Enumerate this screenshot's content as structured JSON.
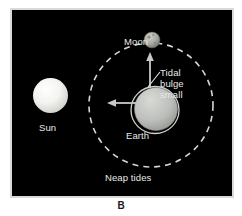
{
  "figure": {
    "caption": "B",
    "panel_background": "#000000",
    "page_background": "#ffffff"
  },
  "diagram": {
    "title_label": "Neap tides",
    "labels": {
      "moon": "Moon",
      "sun": "Sun",
      "earth": "Earth",
      "tidal_bulge": "Tidal\nbulge\nsmall",
      "tidal_bulge_line1": "Tidal",
      "tidal_bulge_line2": "bulge",
      "tidal_bulge_line3": "small",
      "neap_tides": "Neap tides"
    },
    "colors": {
      "text": "#e8e8e8",
      "sun_body": "#f2f2f0",
      "earth_body": "#b9bcb8",
      "moon_body": "#a9a9a5",
      "orbit_dash": "#d6d6d6",
      "arrow": "#cfcfcf",
      "leader_line": "#e8e8e8",
      "caption": "#1a1a1a"
    },
    "bodies": [
      {
        "name": "sun",
        "cx": 50.5,
        "cy": 95.5,
        "r": 17.5
      },
      {
        "name": "earth",
        "cx": 143,
        "cy": 100,
        "r": 22
      },
      {
        "name": "moon",
        "cx": 140,
        "cy": 30,
        "r": 8
      }
    ],
    "orbit": {
      "cx": 139,
      "cy": 95,
      "r": 62,
      "style": "dashed"
    },
    "tidal_bulge": {
      "shape": "ellipse",
      "cx": 143,
      "cy": 100,
      "rx": 23.5,
      "ry": 23,
      "description": "small bulge ring around Earth"
    },
    "arrows": [
      {
        "name": "arrow-up",
        "from": [
          138,
          78
        ],
        "to": [
          138,
          44
        ],
        "direction": "up"
      },
      {
        "name": "arrow-left",
        "from": [
          122,
          94
        ],
        "to": [
          96,
          94
        ],
        "direction": "left"
      }
    ],
    "leader_lines": [
      {
        "name": "tidal-bulge-leader",
        "from": [
          146,
          66
        ],
        "to": [
          136,
          76
        ]
      }
    ]
  }
}
